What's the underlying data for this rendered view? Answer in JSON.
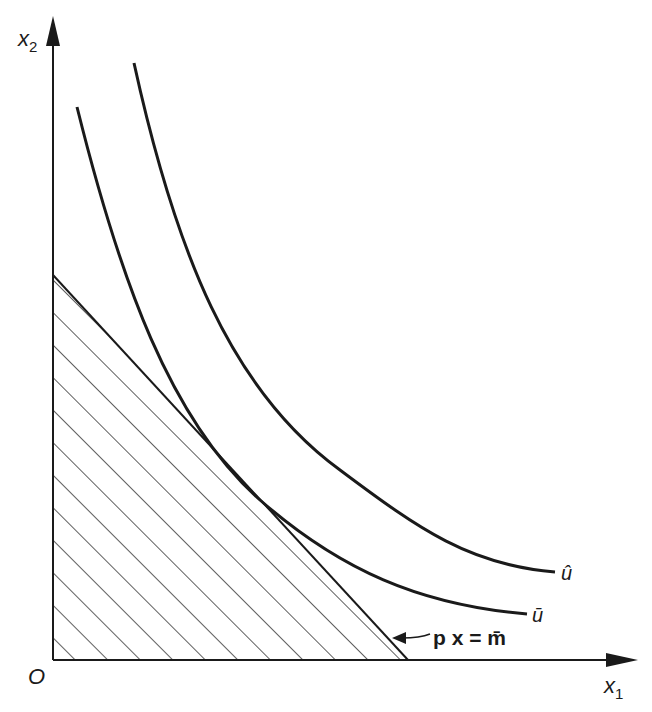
{
  "figure": {
    "type": "indifference-curves-budget-set",
    "axes": {
      "x_label": "x",
      "x_subscript": "1",
      "y_label": "x",
      "y_subscript": "2",
      "origin_label": "O"
    },
    "curves": [
      {
        "id": "u_bar",
        "label": "ū"
      },
      {
        "id": "u_hat",
        "label": "û"
      }
    ],
    "budget_line": {
      "label": "p x = m̄"
    },
    "colors": {
      "ink": "#1a1a1a",
      "background": "#ffffff"
    }
  }
}
